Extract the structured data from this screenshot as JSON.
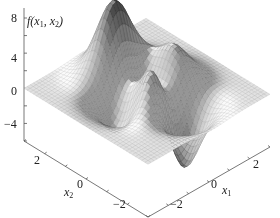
{
  "chart_data": {
    "type": "surface3d",
    "title": "",
    "function": "peaks: 3(1-x1)^2 exp(-x1^2-(x2+1)^2) - 10(x1/5 - x1^3 - x2^5) exp(-x1^2-x2^2) - 1/3 exp(-(x1+1)^2-x2^2)",
    "zlabel": "f(x1, x2)",
    "xlabel": "x1",
    "ylabel": "x2",
    "zticks": [
      8,
      4,
      0,
      -4
    ],
    "zlim": [
      -6,
      8
    ],
    "x1ticks": [
      -2,
      0,
      2
    ],
    "x2ticks": [
      2,
      0,
      -2
    ],
    "x1lim": [
      -3,
      3
    ],
    "x2lim": [
      -3,
      3
    ],
    "grid_resolution": 41,
    "peaks": [
      {
        "x1": 0,
        "x2": 1.6,
        "z": 8.1,
        "kind": "max"
      },
      {
        "x1": 0.2,
        "x2": -1.6,
        "z": -6.5,
        "kind": "min"
      },
      {
        "x1": -1.3,
        "x2": 0.2,
        "z": 3.8,
        "kind": "local max"
      },
      {
        "x1": -0.5,
        "x2": -0.6,
        "z": -3.0,
        "kind": "local min"
      }
    ],
    "colormap": "grayscale (dark = high/low extremes)"
  },
  "axes": {
    "z_label_main": "f",
    "z_label_x1": "x",
    "z_label_sub1": "1",
    "z_label_x2": "x",
    "z_label_sub2": "2",
    "z_ticks": [
      "8",
      "4",
      "0",
      "−4"
    ],
    "x2_ticks": [
      "2",
      "0",
      "−2"
    ],
    "x1_ticks": [
      "−2",
      "0",
      "2"
    ],
    "x1_label": "x",
    "x1_label_sub": "1",
    "x2_label": "x",
    "x2_label_sub": "2"
  }
}
